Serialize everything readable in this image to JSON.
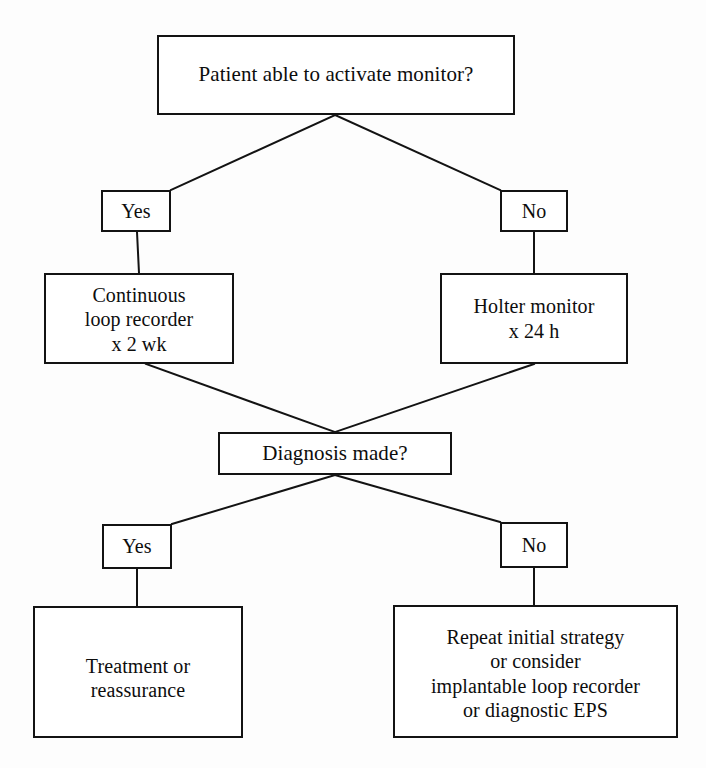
{
  "diagram": {
    "type": "flowchart",
    "orientation": "top-down",
    "canvas": {
      "width": 706,
      "height": 768
    },
    "colors": {
      "background": "#fdfdfd",
      "box_fill": "#ffffff",
      "stroke": "#131313",
      "text": "#0d0d0d"
    },
    "nodes": [
      {
        "id": "question-activate",
        "role": "decision",
        "text": "Patient able to activate monitor?",
        "box": {
          "x": 157,
          "y": 35,
          "w": 358,
          "h": 80
        }
      },
      {
        "id": "branch1-yes",
        "role": "branch-label",
        "text": "Yes",
        "box": {
          "x": 101,
          "y": 190,
          "w": 70,
          "h": 42
        }
      },
      {
        "id": "branch1-no",
        "role": "branch-label",
        "text": "No",
        "box": {
          "x": 500,
          "y": 190,
          "w": 68,
          "h": 42
        }
      },
      {
        "id": "loop-recorder",
        "role": "action",
        "text": "Continuous\nloop recorder\nx 2 wk",
        "box": {
          "x": 44,
          "y": 273,
          "w": 190,
          "h": 91
        }
      },
      {
        "id": "holter-monitor",
        "role": "action",
        "text": "Holter monitor\nx 24 h",
        "box": {
          "x": 440,
          "y": 273,
          "w": 188,
          "h": 91
        }
      },
      {
        "id": "question-diagnosis",
        "role": "decision",
        "text": "Diagnosis made?",
        "box": {
          "x": 218,
          "y": 432,
          "w": 234,
          "h": 43
        }
      },
      {
        "id": "branch2-yes",
        "role": "branch-label",
        "text": "Yes",
        "box": {
          "x": 102,
          "y": 524,
          "w": 70,
          "h": 45
        }
      },
      {
        "id": "branch2-no",
        "role": "branch-label",
        "text": "No",
        "box": {
          "x": 500,
          "y": 522,
          "w": 68,
          "h": 46
        }
      },
      {
        "id": "treatment",
        "role": "outcome",
        "text": "Treatment or\nreassurance",
        "box": {
          "x": 33,
          "y": 606,
          "w": 210,
          "h": 132
        }
      },
      {
        "id": "repeat-strategy",
        "role": "outcome",
        "text": "Repeat initial strategy\nor consider\nimplantable loop recorder\nor diagnostic EPS",
        "box": {
          "x": 393,
          "y": 605,
          "w": 285,
          "h": 133
        }
      }
    ],
    "edges": [
      {
        "id": "edge-activate-to-yes",
        "from": "question-activate",
        "to": "branch1-yes",
        "kind": "diagonal",
        "x1": 335,
        "y1": 115,
        "x2": 171,
        "y2": 190
      },
      {
        "id": "edge-activate-to-no",
        "from": "question-activate",
        "to": "branch1-no",
        "kind": "diagonal",
        "x1": 335,
        "y1": 115,
        "x2": 500,
        "y2": 190
      },
      {
        "id": "edge-yes-to-loop-recorder",
        "from": "branch1-yes",
        "to": "loop-recorder",
        "kind": "vertical",
        "x1": 137,
        "y1": 232,
        "x2": 139,
        "y2": 273
      },
      {
        "id": "edge-no-to-holter",
        "from": "branch1-no",
        "to": "holter-monitor",
        "kind": "vertical",
        "x1": 534,
        "y1": 232,
        "x2": 534,
        "y2": 273
      },
      {
        "id": "edge-loop-recorder-to-diagnosis",
        "from": "loop-recorder",
        "to": "question-diagnosis",
        "kind": "diagonal",
        "x1": 146,
        "y1": 364,
        "x2": 335,
        "y2": 432
      },
      {
        "id": "edge-holter-to-diagnosis",
        "from": "holter-monitor",
        "to": "question-diagnosis",
        "kind": "diagonal",
        "x1": 534,
        "y1": 364,
        "x2": 335,
        "y2": 432
      },
      {
        "id": "edge-diagnosis-to-yes",
        "from": "question-diagnosis",
        "to": "branch2-yes",
        "kind": "diagonal",
        "x1": 335,
        "y1": 475,
        "x2": 172,
        "y2": 524
      },
      {
        "id": "edge-diagnosis-to-no",
        "from": "question-diagnosis",
        "to": "branch2-no",
        "kind": "diagonal",
        "x1": 335,
        "y1": 475,
        "x2": 500,
        "y2": 522
      },
      {
        "id": "edge-yes-to-treatment",
        "from": "branch2-yes",
        "to": "treatment",
        "kind": "vertical",
        "x1": 137,
        "y1": 569,
        "x2": 137,
        "y2": 606
      },
      {
        "id": "edge-no-to-repeat",
        "from": "branch2-no",
        "to": "repeat-strategy",
        "kind": "vertical",
        "x1": 534,
        "y1": 568,
        "x2": 534,
        "y2": 605
      }
    ]
  }
}
